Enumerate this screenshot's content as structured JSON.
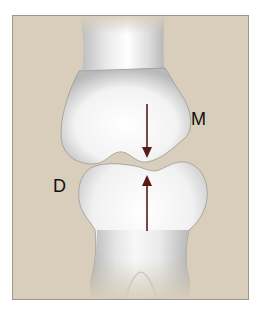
{
  "diagram": {
    "labels": {
      "upper": "M",
      "lower": "D"
    },
    "arrows": [
      {
        "name": "downward-arrow",
        "direction": "down",
        "color": "#5a1a1a"
      },
      {
        "name": "upward-arrow",
        "direction": "up",
        "color": "#5a1a1a"
      }
    ],
    "colors": {
      "background": "#d8cebb",
      "frame_border": "#9c968c",
      "bone": "#f2f2f2",
      "arrow": "#5a1a1a"
    }
  }
}
